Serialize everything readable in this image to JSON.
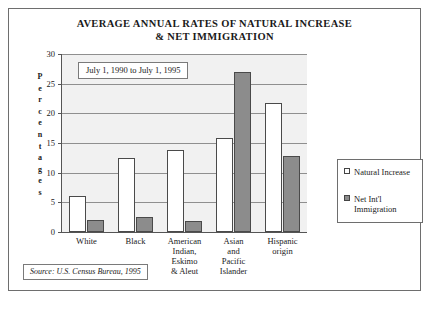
{
  "chart_data": {
    "type": "bar",
    "title": "AVERAGE ANNUAL RATES OF NATURAL INCREASE & NET IMMIGRATION",
    "title_line1": "AVERAGE ANNUAL RATES OF NATURAL INCREASE",
    "title_line2": "& NET IMMIGRATION",
    "xlabel": "",
    "ylabel": "Percentages",
    "ylim": [
      0,
      30
    ],
    "yticks": [
      0,
      5,
      10,
      15,
      20,
      25,
      30
    ],
    "grid": true,
    "legend_position": "right",
    "categories": [
      "White",
      "Black",
      "American Indian, Eskimo & Aleut",
      "Asian and Pacific Islander",
      "Hispanic origin"
    ],
    "category_lines": [
      [
        "White"
      ],
      [
        "Black"
      ],
      [
        "American",
        "Indian,",
        "Eskimo",
        "& Aleut"
      ],
      [
        "Asian",
        "and",
        "Pacific",
        "Islander"
      ],
      [
        "Hispanic",
        "origin"
      ]
    ],
    "series": [
      {
        "name": "Natural Increase",
        "values": [
          6.0,
          12.5,
          13.8,
          15.8,
          21.8
        ]
      },
      {
        "name": "Net Int'l Immigration",
        "values": [
          2.0,
          2.5,
          1.8,
          27.0,
          12.8
        ]
      }
    ],
    "annotation": "July 1, 1990 to July 1, 1995",
    "source": "Source: U.S. Census Bureau, 1995"
  },
  "legend": {
    "items": [
      {
        "label": "Natural Increase",
        "label_lines": [
          "Natural Increase"
        ],
        "color": "#ffffff"
      },
      {
        "label": "Net Int'l Immigration",
        "label_lines": [
          "Net Int'l",
          "Immigration"
        ],
        "color": "#8c8c8c"
      }
    ]
  },
  "colors": {
    "natural_increase": "#ffffff",
    "net_immigration": "#8c8c8c",
    "plot_background": "#f1f1f1",
    "gridline": "#8f8f8f",
    "border": "#6e6e6e"
  }
}
